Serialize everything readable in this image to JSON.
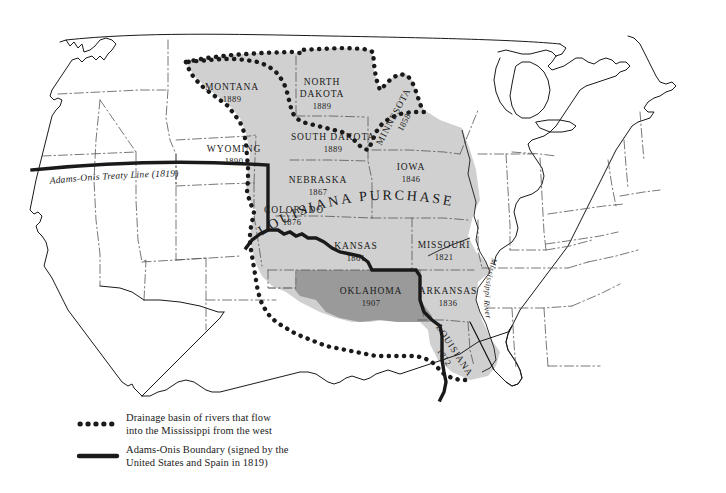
{
  "map": {
    "title_label": "LOUISIANA PURCHASE",
    "treaty_line_label": "Adams-Onis Treaty Line (1819)",
    "river_label": "Mississippi River",
    "colors": {
      "background": "#ffffff",
      "purchase_fill": "#d0d0d0",
      "oklahoma_fill": "#9a9a9a",
      "outline": "#1a1a1a",
      "state_border": "#555555",
      "boundary_line": "#1a1a1a",
      "drainage_dots": "#1a1a1a"
    },
    "states": [
      {
        "name": "MONTANA",
        "year": "1889",
        "x": 232,
        "y": 90,
        "rotate": 0
      },
      {
        "name": "NORTH",
        "year": "",
        "x": 320,
        "y": 88,
        "rotate": 0
      },
      {
        "name": "DAKOTA",
        "year": "1889",
        "x": 320,
        "y": 100,
        "rotate": 0
      },
      {
        "name": "SOUTH DAKOTA",
        "year": "1889",
        "x": 333,
        "y": 140,
        "rotate": 0
      },
      {
        "name": "WYOMING",
        "year": "1890",
        "x": 234,
        "y": 152,
        "rotate": 0
      },
      {
        "name": "NEBRASKA",
        "year": "1867",
        "x": 318,
        "y": 183,
        "rotate": 0
      },
      {
        "name": "COLORADO",
        "year": "1876",
        "x": 290,
        "y": 213,
        "rotate": 0
      },
      {
        "name": "MINNESOTA",
        "year": "1858",
        "x": 396,
        "y": 118,
        "rotate": -62
      },
      {
        "name": "IOWA",
        "year": "1846",
        "x": 411,
        "y": 170,
        "rotate": 0
      },
      {
        "name": "KANSAS",
        "year": "1861",
        "x": 356,
        "y": 249,
        "rotate": 0
      },
      {
        "name": "MISSOURI",
        "year": "1821",
        "x": 444,
        "y": 248,
        "rotate": 0
      },
      {
        "name": "OKLAHOMA",
        "year": "1907",
        "x": 371,
        "y": 294,
        "rotate": 0
      },
      {
        "name": "ARKANSAS",
        "year": "1836",
        "x": 446,
        "y": 294,
        "rotate": 0
      },
      {
        "name": "LOUISIANA",
        "year": "1812",
        "x": 456,
        "y": 360,
        "rotate": 57
      }
    ]
  },
  "legend": {
    "items": [
      {
        "symbol": "dotted-line",
        "line1": "Drainage basin of rivers that flow",
        "line2": "into the Mississippi from the west"
      },
      {
        "symbol": "solid-line",
        "line1": "Adams-Onis Boundary (signed by the",
        "line2": "United States and Spain in 1819)"
      }
    ]
  }
}
